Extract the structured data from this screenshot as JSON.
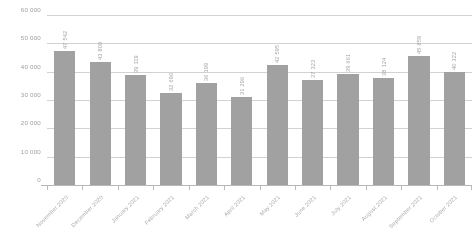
{
  "chart_data": {
    "type": "bar",
    "title": "",
    "subtitle": "",
    "xlabel": "",
    "ylabel": "",
    "ylim": [
      0,
      60000
    ],
    "grid": true,
    "legend": "none",
    "bar_color": "#8d8d8d",
    "categories": [
      "November 2020",
      "December 2020",
      "January 2021",
      "February 2021",
      "March 2021",
      "April 2021",
      "May 2021",
      "June 2021",
      "July 2021",
      "August 2021",
      "September 2021",
      "October 2021"
    ],
    "values": [
      47542,
      43809,
      39119,
      32696,
      36199,
      31296,
      42595,
      37323,
      39661,
      38124,
      45859,
      40322
    ],
    "value_labels": [
      "47 542",
      "43 809",
      "39 119",
      "32 696",
      "36 199",
      "31 296",
      "42 595",
      "37 323",
      "39 661",
      "38 124",
      "45 859",
      "40 322"
    ],
    "ytick_values": [
      0,
      10000,
      20000,
      30000,
      40000,
      50000,
      60000
    ],
    "ytick_labels": [
      "0",
      "10 000",
      "20 000",
      "30 000",
      "40 000",
      "50 000",
      "60 000"
    ]
  }
}
